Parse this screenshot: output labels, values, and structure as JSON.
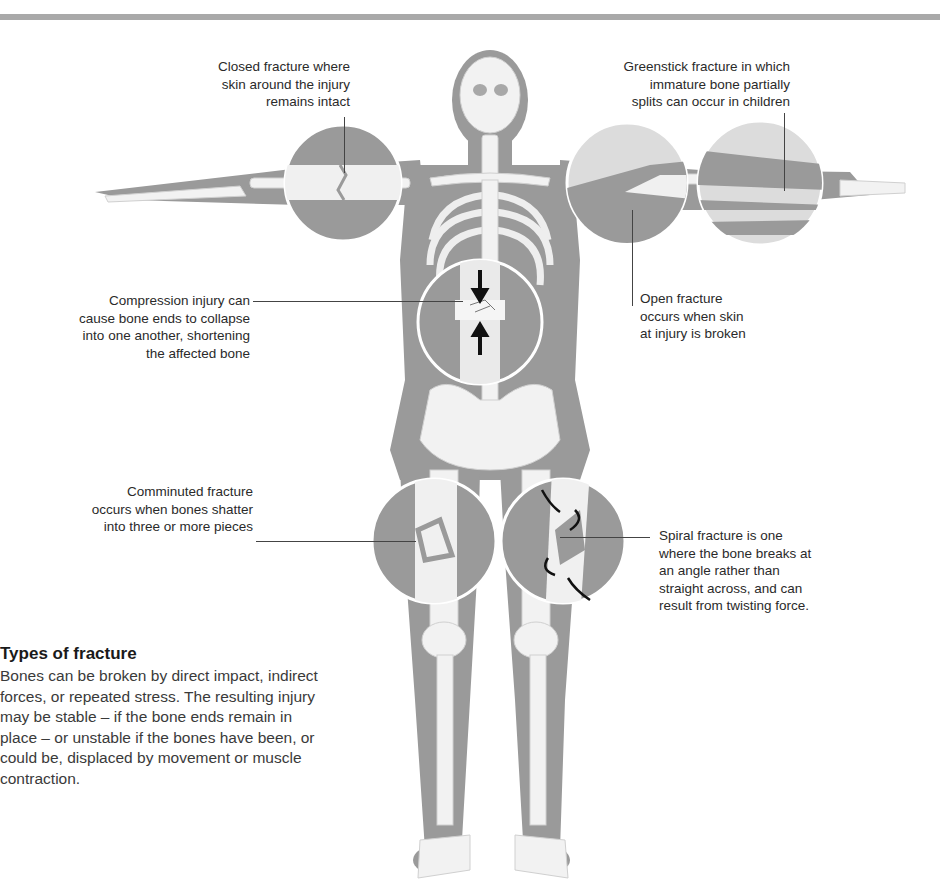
{
  "figure": {
    "colors": {
      "flesh": "#9a9a9a",
      "bone": "#f2f2f2",
      "bone_shadow": "#d6d6d6",
      "divider": "#a9a9a9",
      "text": "#2a2a2a"
    }
  },
  "callouts": {
    "closed": {
      "lines": [
        "Closed fracture where",
        "skin around the injury",
        "remains intact"
      ]
    },
    "greenstick": {
      "lines": [
        "Greenstick fracture in which",
        "immature bone partially",
        "splits can occur in children"
      ]
    },
    "compression": {
      "lines": [
        "Compression injury can",
        "cause bone ends to collapse",
        "into one another, shortening",
        "the affected bone"
      ]
    },
    "open": {
      "lines": [
        "Open fracture",
        "occurs when skin",
        "at injury is broken"
      ]
    },
    "comminuted": {
      "lines": [
        "Comminuted fracture",
        "occurs when bones shatter",
        "into three or more pieces"
      ]
    },
    "spiral": {
      "lines": [
        "Spiral fracture is one",
        "where the bone breaks at",
        "an angle rather than",
        "straight across, and can",
        "result from twisting force."
      ]
    }
  },
  "sidebar": {
    "title": "Types of fracture",
    "body": "Bones can be broken by direct impact, indirect forces, or repeated stress. The resulting injury may be stable – if the bone ends remain in place – or unstable if the bones have been, or could be, displaced by movement or muscle contraction."
  }
}
